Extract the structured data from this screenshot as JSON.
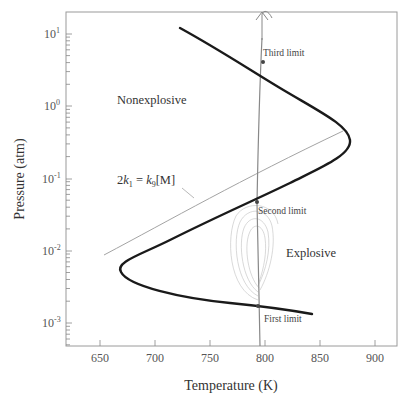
{
  "chart_data": {
    "type": "line",
    "title": "",
    "xlabel": "Temperature (K)",
    "ylabel": "Pressure (atm)",
    "xlim": [
      619,
      920
    ],
    "ylim": [
      0.00048,
      20
    ],
    "yscale": "log",
    "grid": false,
    "x_ticks": [
      650,
      700,
      750,
      800,
      850,
      900
    ],
    "x_tick_labels": [
      "650",
      "700",
      "750",
      "800",
      "850",
      "900"
    ],
    "y_ticks": [
      0.001,
      0.01,
      0.1,
      1,
      10
    ],
    "y_tick_labels": [
      {
        "base": "10",
        "exp": "-3"
      },
      {
        "base": "10",
        "exp": "-2"
      },
      {
        "base": "10",
        "exp": "-1"
      },
      {
        "base": "10",
        "exp": "0"
      },
      {
        "base": "10",
        "exp": "1"
      }
    ],
    "series": [
      {
        "name": "Explosion limits (H2-O2)",
        "style": "thick black",
        "points": [
          {
            "T": 723,
            "P": 12
          },
          {
            "T": 770,
            "P": 4.5
          },
          {
            "T": 810,
            "P": 1.6
          },
          {
            "T": 843,
            "P": 0.55
          },
          {
            "T": 849,
            "P": 0.33
          },
          {
            "T": 835,
            "P": 0.18
          },
          {
            "T": 770,
            "P": 0.048
          },
          {
            "T": 720,
            "P": 0.018
          },
          {
            "T": 680,
            "P": 0.008
          },
          {
            "T": 670,
            "P": 0.005
          },
          {
            "T": 690,
            "P": 0.003
          },
          {
            "T": 760,
            "P": 0.0019
          },
          {
            "T": 842,
            "P": 0.0014
          }
        ]
      },
      {
        "name": "2k1 = k9[M]",
        "style": "thin gray",
        "points": [
          {
            "T": 650,
            "P": 0.009
          },
          {
            "T": 760,
            "P": 0.06
          },
          {
            "T": 870,
            "P": 0.45
          }
        ]
      },
      {
        "name": "Trajectory at ~760 K",
        "style": "thin gray vertical with arrow",
        "points": [
          {
            "T": 761,
            "P": 0.00048
          },
          {
            "T": 763,
            "P": 0.05
          },
          {
            "T": 767,
            "P": 5
          },
          {
            "T": 768,
            "P": 10
          }
        ]
      }
    ],
    "annotations": [
      {
        "text": "Nonexplosive",
        "T": 660,
        "P": 1.0
      },
      {
        "text": "Explosive",
        "T": 810,
        "P": 0.011
      },
      {
        "text": "Third limit",
        "T": 765,
        "P": 7
      },
      {
        "text": "Second limit",
        "T": 763,
        "P": 0.035
      },
      {
        "text": "First limit",
        "T": 765,
        "P": 0.0012
      }
    ],
    "equation_label": {
      "prefix": "2",
      "k1": "k",
      "k1_sub": "1",
      "eq": " = ",
      "k9": "k",
      "k9_sub": "9",
      "suffix": "[M]"
    }
  },
  "labels": {
    "nonexplosive": "Nonexplosive",
    "explosive": "Explosive",
    "third_limit": "Third limit",
    "second_limit": "Second limit",
    "first_limit": "First limit",
    "xlabel": "Temperature (K)",
    "ylabel": "Pressure (atm)",
    "x_ticks": [
      "650",
      "700",
      "750",
      "800",
      "850",
      "900"
    ],
    "y_base": "10",
    "y_exps": [
      "1",
      "0",
      "-1",
      "-2",
      "-3"
    ]
  }
}
